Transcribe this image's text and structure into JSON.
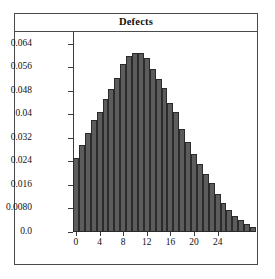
{
  "figure": {
    "title": "Defects",
    "background_color": "#ffffff",
    "frame_color": "#4a4a4a",
    "bar_fill_color": "#5c5c5c",
    "bar_edge_color": "#2b2b2b"
  },
  "chart_data": {
    "type": "bar",
    "title": "Defects",
    "xlabel": "",
    "ylabel": "",
    "grid": false,
    "legend": null,
    "xlim": [
      -0.5,
      30.5
    ],
    "ylim": [
      0.0,
      0.068
    ],
    "x_tick_labels": [
      "0",
      "4",
      "8",
      "12",
      "16",
      "20",
      "24"
    ],
    "x_tick_values": [
      0,
      4,
      8,
      12,
      16,
      20,
      24
    ],
    "y_tick_labels": [
      "0.0",
      "0.0080",
      "0.016",
      "0.024",
      "0.032",
      "0.04",
      "0.048",
      "0.056",
      "0.064"
    ],
    "y_tick_values": [
      0.0,
      0.008,
      0.016,
      0.024,
      0.032,
      0.04,
      0.048,
      0.056,
      0.064
    ],
    "categories": [
      0,
      1,
      2,
      3,
      4,
      5,
      6,
      7,
      8,
      9,
      10,
      11,
      12,
      13,
      14,
      15,
      16,
      17,
      18,
      19,
      20,
      21,
      22,
      23,
      24,
      25,
      26,
      27,
      28,
      29,
      30
    ],
    "values": [
      0.0253,
      0.0295,
      0.0338,
      0.0381,
      0.0407,
      0.0452,
      0.0487,
      0.0523,
      0.057,
      0.06,
      0.061,
      0.0607,
      0.059,
      0.0553,
      0.0521,
      0.049,
      0.044,
      0.0407,
      0.035,
      0.0305,
      0.0265,
      0.023,
      0.0196,
      0.0165,
      0.013,
      0.0098,
      0.0075,
      0.0056,
      0.004,
      0.0028,
      0.0016
    ]
  }
}
